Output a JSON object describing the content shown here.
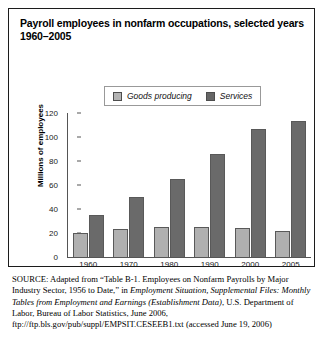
{
  "figure": {
    "title": "Payroll employees in nonfarm occupations, selected years 1960–2005"
  },
  "legend": {
    "items": [
      {
        "label": "Goods producing",
        "color": "#b3b3b3",
        "swatch_name": "legend-swatch-goods"
      },
      {
        "label": "Services",
        "color": "#666666",
        "swatch_name": "legend-swatch-services"
      }
    ]
  },
  "axes": {
    "y_title": "Millions of employees",
    "y_ticks": [
      "0",
      "20",
      "40",
      "60",
      "80",
      "100",
      "120"
    ],
    "x_ticks": [
      "1960",
      "1970",
      "1980",
      "1990",
      "2000",
      "2005"
    ]
  },
  "source": {
    "label": "SOURCE:",
    "text_1": " Adapted from “Table B-1. Employees on Nonfarm Payrolls by Major Industry Sector, 1956 to Date,” in ",
    "italic_1": "Employment Situation, Supplemental Files: Monthly Tables from Employment and Earnings (Establishment Data)",
    "text_2": ", U.S. Department of Labor, Bureau of Labor Statistics, June 2006, ftp://ftp.bls.gov/pub/suppl/EMPSIT.CESEEB1.txt (accessed June 19, 2006)"
  },
  "chart_data": {
    "type": "bar",
    "title": "Payroll employees in nonfarm occupations, selected years 1960–2005",
    "xlabel": "",
    "ylabel": "Millions of employees",
    "ylim": [
      0,
      120
    ],
    "ytick_step": 20,
    "grid": false,
    "legend_position": "top-right",
    "categories": [
      "1960",
      "1970",
      "1980",
      "1990",
      "2000",
      "2005"
    ],
    "series": [
      {
        "name": "Goods producing",
        "color": "#b0b0b0",
        "values": [
          20,
          23,
          25,
          25,
          24,
          22
        ]
      },
      {
        "name": "Services",
        "color": "#6a6a6a",
        "values": [
          35,
          50,
          65,
          86,
          107,
          113
        ]
      }
    ]
  }
}
